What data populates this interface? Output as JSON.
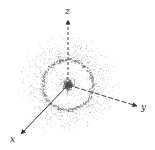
{
  "diagram": {
    "type": "electron-probability-cloud",
    "axes": {
      "x": {
        "label": "x"
      },
      "y": {
        "label": "y"
      },
      "z": {
        "label": "z"
      }
    },
    "colors": {
      "dots": "#555555",
      "axis": "#333333",
      "background": "#ffffff"
    }
  }
}
